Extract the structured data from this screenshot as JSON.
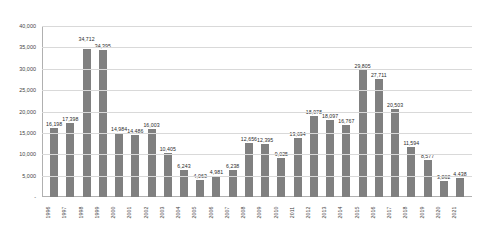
{
  "chart_data": {
    "type": "bar",
    "title": "",
    "xlabel": "",
    "ylabel": "",
    "ylim": [
      0,
      40000
    ],
    "yticks": [
      0,
      5000,
      10000,
      15000,
      20000,
      25000,
      30000,
      35000,
      40000
    ],
    "ytick_labels": [
      "-",
      "5,000",
      "10,000",
      "15,000",
      "20,000",
      "25,000",
      "30,000",
      "35,000",
      "40,000"
    ],
    "grid": true,
    "legend": "none",
    "bar_color": "#808080",
    "gridline_color": "#d9d9d9",
    "categories": [
      "1996",
      "1997",
      "1998",
      "1999",
      "2000",
      "2001",
      "2002",
      "2003",
      "2004",
      "2005",
      "2006",
      "2007",
      "2008",
      "2009",
      "2010",
      "2011",
      "2012",
      "2013",
      "2014",
      "2015",
      "2016",
      "2017",
      "2018",
      "2019",
      "2020",
      "2021"
    ],
    "values": [
      16198,
      17398,
      34712,
      34395,
      14984,
      14486,
      16003,
      10405,
      6243,
      4063,
      4981,
      6238,
      12656,
      12395,
      9025,
      13694,
      18978,
      18097,
      16767,
      29805,
      27711,
      20503,
      11594,
      8577,
      3862,
      4438
    ],
    "value_labels": [
      "16,198",
      "17,398",
      "34,712",
      "34,395",
      "14,984",
      "14,486",
      "16,003",
      "10,405",
      "6,243",
      "4,063",
      "4,981",
      "6,238",
      "12,656",
      "12,395",
      "9,025",
      "13,694",
      "18,978",
      "18,097",
      "16,767",
      "29,805",
      "27,711",
      "20,503",
      "11,594",
      "8,577",
      "3,862",
      "4,438"
    ]
  }
}
